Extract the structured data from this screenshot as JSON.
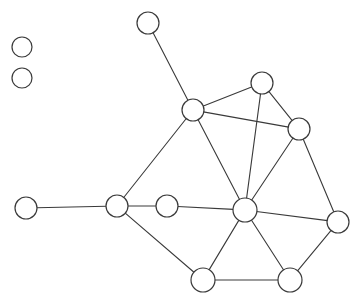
{
  "figure": {
    "type": "node-link-graph",
    "width": 361,
    "height": 301,
    "background_color": "#ffffff",
    "node_fill_color": "#ffffff",
    "node_stroke_color": "#3a3a3a",
    "edge_color": "#3a3a3a",
    "node_radius_default": 10,
    "node_count": 13,
    "edge_count": 19,
    "isolated_node_count": 2
  },
  "graph": {
    "nodes": [
      {
        "id": "n1",
        "name": "isolated-node-upper",
        "x": 22,
        "y": 47,
        "r": 10
      },
      {
        "id": "n2",
        "name": "isolated-node-lower",
        "x": 22,
        "y": 78,
        "r": 10
      },
      {
        "id": "n3",
        "name": "top-pendant-node",
        "x": 148,
        "y": 23,
        "r": 11
      },
      {
        "id": "n4",
        "name": "upper-left-hub-node",
        "x": 193,
        "y": 110,
        "r": 11
      },
      {
        "id": "n5",
        "name": "upper-right-node",
        "x": 262,
        "y": 83,
        "r": 11
      },
      {
        "id": "n6",
        "name": "right-upper-node",
        "x": 299,
        "y": 129,
        "r": 11
      },
      {
        "id": "n7",
        "name": "left-pendant-node",
        "x": 26,
        "y": 208,
        "r": 11
      },
      {
        "id": "n8",
        "name": "left-junction-node",
        "x": 117,
        "y": 206,
        "r": 11
      },
      {
        "id": "n9",
        "name": "mid-chain-node",
        "x": 167,
        "y": 206,
        "r": 11
      },
      {
        "id": "n10",
        "name": "center-hub-node",
        "x": 245,
        "y": 210,
        "r": 12
      },
      {
        "id": "n11",
        "name": "right-lower-node",
        "x": 338,
        "y": 222,
        "r": 11
      },
      {
        "id": "n12",
        "name": "bottom-left-node",
        "x": 203,
        "y": 280,
        "r": 12
      },
      {
        "id": "n13",
        "name": "bottom-right-node",
        "x": 290,
        "y": 280,
        "r": 12
      }
    ],
    "edges": [
      {
        "source": "n3",
        "target": "n4"
      },
      {
        "source": "n4",
        "target": "n5"
      },
      {
        "source": "n4",
        "target": "n6"
      },
      {
        "source": "n4",
        "target": "n8"
      },
      {
        "source": "n4",
        "target": "n10"
      },
      {
        "source": "n5",
        "target": "n6"
      },
      {
        "source": "n5",
        "target": "n10"
      },
      {
        "source": "n6",
        "target": "n10"
      },
      {
        "source": "n6",
        "target": "n11"
      },
      {
        "source": "n7",
        "target": "n8"
      },
      {
        "source": "n8",
        "target": "n9"
      },
      {
        "source": "n8",
        "target": "n12"
      },
      {
        "source": "n9",
        "target": "n10"
      },
      {
        "source": "n10",
        "target": "n11"
      },
      {
        "source": "n10",
        "target": "n12"
      },
      {
        "source": "n10",
        "target": "n13"
      },
      {
        "source": "n11",
        "target": "n13"
      },
      {
        "source": "n12",
        "target": "n13"
      },
      {
        "source": "n9",
        "target": "n8"
      }
    ]
  }
}
